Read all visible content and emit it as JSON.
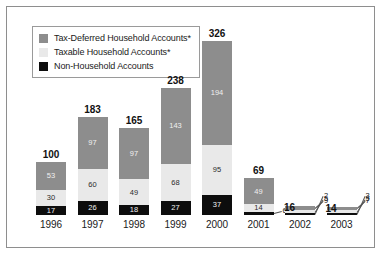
{
  "legend": {
    "items": [
      {
        "label": "Tax-Deferred Household Accounts*",
        "color": "#8d8d8d",
        "key": "deferred"
      },
      {
        "label": "Taxable Household Accounts*",
        "color": "#e9e9e9",
        "key": "taxable"
      },
      {
        "label": "Non-Household Accounts",
        "color": "#0d0d0d",
        "key": "nonhh"
      }
    ]
  },
  "chart_data": {
    "type": "bar",
    "subtype": "stacked",
    "title": "",
    "xlabel": "",
    "ylabel": "",
    "grid": false,
    "legend_position": "top-left",
    "ylim": [
      0,
      326
    ],
    "categories": [
      "1996",
      "1997",
      "1998",
      "1999",
      "2000",
      "2001",
      "2002",
      "2003"
    ],
    "series": [
      {
        "name": "Non-Household Accounts",
        "color": "#0d0d0d",
        "values": [
          17,
          26,
          18,
          27,
          37,
          6,
          2,
          3
        ]
      },
      {
        "name": "Taxable Household Accounts*",
        "color": "#e9e9e9",
        "values": [
          30,
          60,
          49,
          68,
          95,
          14,
          5,
          5
        ]
      },
      {
        "name": "Tax-Deferred Household Accounts*",
        "color": "#8d8d8d",
        "values": [
          53,
          97,
          97,
          143,
          194,
          49,
          9,
          7
        ]
      }
    ],
    "totals": [
      100,
      183,
      165,
      238,
      326,
      69,
      16,
      14
    ],
    "bars": [
      {
        "year": "1996",
        "total": 100,
        "segments": [
          {
            "key": "nonhh",
            "value": 17,
            "label": "17",
            "callout": false
          },
          {
            "key": "taxable",
            "value": 30,
            "label": "30",
            "callout": false
          },
          {
            "key": "deferred",
            "value": 53,
            "label": "53",
            "callout": false
          }
        ]
      },
      {
        "year": "1997",
        "total": 183,
        "segments": [
          {
            "key": "nonhh",
            "value": 26,
            "label": "26",
            "callout": false
          },
          {
            "key": "taxable",
            "value": 60,
            "label": "60",
            "callout": false
          },
          {
            "key": "deferred",
            "value": 97,
            "label": "97",
            "callout": false
          }
        ]
      },
      {
        "year": "1998",
        "total": 165,
        "segments": [
          {
            "key": "nonhh",
            "value": 18,
            "label": "18",
            "callout": false
          },
          {
            "key": "taxable",
            "value": 49,
            "label": "49",
            "callout": false
          },
          {
            "key": "deferred",
            "value": 97,
            "label": "97",
            "callout": false
          }
        ]
      },
      {
        "year": "1999",
        "total": 238,
        "segments": [
          {
            "key": "nonhh",
            "value": 27,
            "label": "27",
            "callout": false
          },
          {
            "key": "taxable",
            "value": 68,
            "label": "68",
            "callout": false
          },
          {
            "key": "deferred",
            "value": 143,
            "label": "143",
            "callout": false
          }
        ]
      },
      {
        "year": "2000",
        "total": 326,
        "segments": [
          {
            "key": "nonhh",
            "value": 37,
            "label": "37",
            "callout": false
          },
          {
            "key": "taxable",
            "value": 95,
            "label": "95",
            "callout": false
          },
          {
            "key": "deferred",
            "value": 194,
            "label": "194",
            "callout": false
          }
        ]
      },
      {
        "year": "2001",
        "total": 69,
        "segments": [
          {
            "key": "nonhh",
            "value": 6,
            "label": "6",
            "callout": true
          },
          {
            "key": "taxable",
            "value": 14,
            "label": "14",
            "callout": false
          },
          {
            "key": "deferred",
            "value": 49,
            "label": "49",
            "callout": false
          }
        ]
      },
      {
        "year": "2002",
        "total": 16,
        "segments": [
          {
            "key": "nonhh",
            "value": 2,
            "label": "2",
            "callout": true
          },
          {
            "key": "taxable",
            "value": 5,
            "label": "5",
            "callout": true
          },
          {
            "key": "deferred",
            "value": 9,
            "label": "9",
            "callout": true
          }
        ]
      },
      {
        "year": "2003",
        "total": 14,
        "segments": [
          {
            "key": "nonhh",
            "value": 3,
            "label": "3",
            "callout": true
          },
          {
            "key": "taxable",
            "value": 5,
            "label": "5",
            "callout": true
          },
          {
            "key": "deferred",
            "value": 7,
            "label": "7",
            "callout": true
          }
        ]
      }
    ]
  }
}
